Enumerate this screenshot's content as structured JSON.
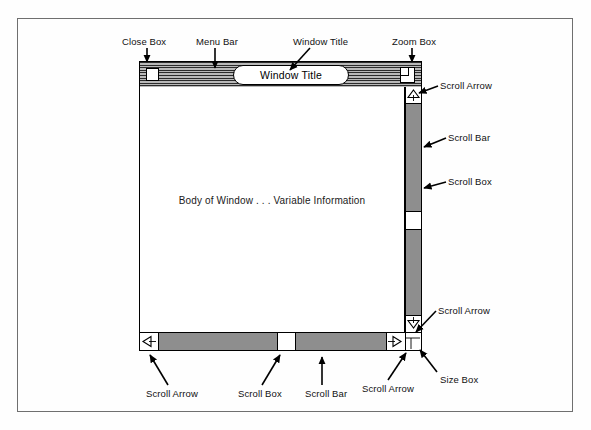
{
  "diagram": {
    "window": {
      "title_text": "Window Title",
      "body_text": "Body of Window . . . Variable Information"
    },
    "labels": {
      "close_box": "Close Box",
      "menu_bar": "Menu Bar",
      "window_title": "Window Title",
      "zoom_box": "Zoom Box",
      "scroll_arrow_right_top": "Scroll Arrow",
      "scroll_bar_right": "Scroll Bar",
      "scroll_box_right": "Scroll Box",
      "scroll_arrow_right_bottom": "Scroll Arrow",
      "size_box": "Size Box",
      "scroll_arrow_bottom_left": "Scroll Arrow",
      "scroll_box_bottom": "Scroll Box",
      "scroll_bar_bottom": "Scroll Bar",
      "scroll_arrow_bottom_right": "Scroll Arrow"
    },
    "icons": {
      "scroll_arrow_up": "triangle-up-icon",
      "scroll_arrow_down": "triangle-down-icon",
      "scroll_arrow_left": "triangle-left-icon",
      "scroll_arrow_right": "triangle-right-icon",
      "size_box_grip": "size-grip-icon"
    },
    "colors": {
      "ink": "#000000",
      "paper": "#ffffff",
      "frame": "#6f6f6f",
      "track_gray": "#c9c9c9",
      "titlebar_stripe_dark": "#2b2b2b",
      "titlebar_stripe_light": "#b9b9b9"
    }
  }
}
